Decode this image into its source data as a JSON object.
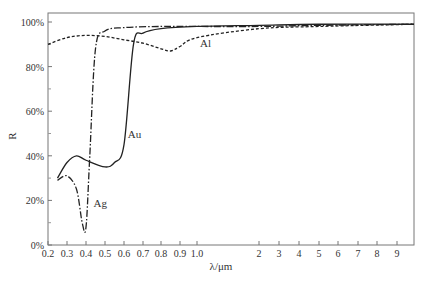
{
  "chart_data": {
    "type": "line",
    "title": "",
    "xlabel": "λ/μm",
    "ylabel": "R",
    "xscale": "mixed-log",
    "xlim": [
      0.2,
      10
    ],
    "ylim": [
      0,
      100
    ],
    "grid": false,
    "legend": "inline labels",
    "x_ticks": [
      "0.2",
      "0.3",
      "0.4",
      "0.5",
      "0.6",
      "0.7",
      "0.8",
      "0.9",
      "1.0",
      "2",
      "3",
      "4",
      "5",
      "6",
      "7",
      "8",
      "9"
    ],
    "y_ticks": [
      "0%",
      "20%",
      "40%",
      "60%",
      "80%",
      "100%"
    ],
    "series": [
      {
        "name": "Ag",
        "style": "dash-dot",
        "x": [
          0.25,
          0.3,
          0.35,
          0.38,
          0.4,
          0.42,
          0.45,
          0.5,
          0.6,
          0.8,
          1.0,
          2,
          5,
          10
        ],
        "y": [
          29,
          31,
          25,
          10,
          8,
          40,
          88,
          96,
          97.5,
          98,
          98,
          98,
          98.5,
          99
        ]
      },
      {
        "name": "Au",
        "style": "solid",
        "x": [
          0.25,
          0.3,
          0.35,
          0.4,
          0.5,
          0.55,
          0.6,
          0.65,
          0.7,
          0.8,
          1.0,
          2,
          5,
          10
        ],
        "y": [
          30,
          37,
          40,
          38,
          35,
          37,
          45,
          90,
          95,
          97,
          98,
          98.5,
          99,
          99
        ]
      },
      {
        "name": "Al",
        "style": "dashed",
        "x": [
          0.2,
          0.3,
          0.4,
          0.5,
          0.6,
          0.7,
          0.8,
          0.85,
          0.9,
          1.0,
          2,
          5,
          10
        ],
        "y": [
          90,
          93,
          94,
          93.5,
          92,
          90.5,
          88,
          87,
          89,
          93,
          97,
          98,
          99
        ]
      }
    ],
    "annotations": [
      {
        "text": "Al",
        "x": 1.05,
        "y": 89
      },
      {
        "text": "Au",
        "x": 0.62,
        "y": 48
      },
      {
        "text": "Ag",
        "x": 0.44,
        "y": 17
      }
    ]
  }
}
